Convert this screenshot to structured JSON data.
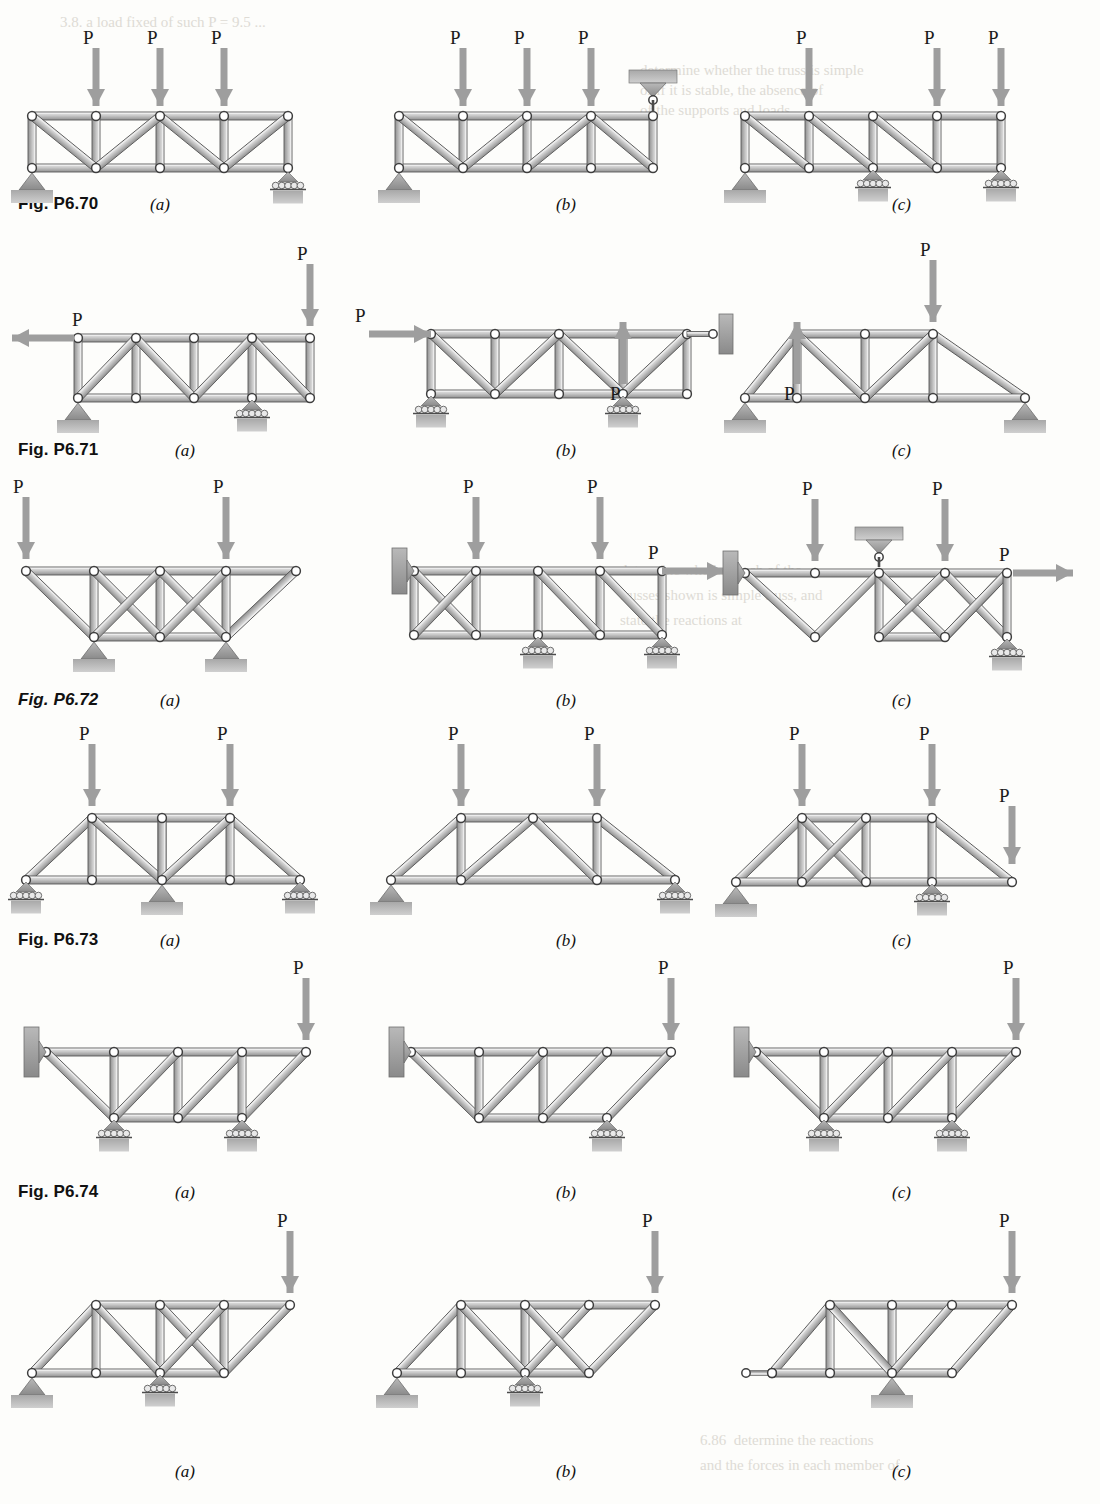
{
  "page": {
    "width": 1100,
    "height": 1504,
    "background": "#fdfdfb",
    "member_color_light": "#d8d8d8",
    "member_color_dark": "#8e8e8e",
    "outline_color": "#4a4a4a",
    "joint_fill": "#ffffff",
    "arrow_color": "#9a9a9a",
    "support_color": "#a5a5a5",
    "label_color": "#111111"
  },
  "load_label": "P",
  "figures": [
    {
      "id": "fig-p6-70",
      "label": "Fig. P6.70",
      "italic": false,
      "panels": [
        {
          "letter": "(a)",
          "name": "panel-a",
          "description": "Parallel chord truss, 4 panels, pin support left bottom, roller support right bottom, three downward loads P on top chord",
          "loads": [
            "P",
            "P",
            "P"
          ]
        },
        {
          "letter": "(b)",
          "name": "panel-b",
          "description": "Parallel chord truss with hanger link support at right top, pin support left bottom, three downward loads P on top chord",
          "loads": [
            "P",
            "P",
            "P"
          ]
        },
        {
          "letter": "(c)",
          "name": "panel-c",
          "description": "Parallel chord truss, pin support left bottom, two roller supports at bottom, three downward loads P on top chord",
          "loads": [
            "P",
            "P",
            "P"
          ]
        }
      ]
    },
    {
      "id": "fig-p6-71",
      "label": "Fig. P6.71",
      "italic": false,
      "panels": [
        {
          "letter": "(a)",
          "name": "panel-a",
          "description": "Parallel chord truss, horizontal load P to the left at top-left joint, downward load P at top-right joint, pin and roller supports on bottom chord",
          "loads": [
            "P",
            "P"
          ]
        },
        {
          "letter": "(b)",
          "name": "panel-b",
          "description": "Parallel chord truss with horizontal load P to the right at top-left, upward load P at an interior top joint, link support at right, roller supports at bottom",
          "loads": [
            "P",
            "P"
          ]
        },
        {
          "letter": "(c)",
          "name": "panel-c",
          "description": "Trapezoidal truss, upward load P at left top joint, downward load P at right top joint, pin support left and pin support right",
          "loads": [
            "P",
            "P"
          ]
        }
      ]
    },
    {
      "id": "fig-p6-72",
      "label": "Fig. P6.72",
      "italic": true,
      "panels": [
        {
          "letter": "(a)",
          "name": "panel-a",
          "description": "Inverted truss with straight top chord and cross-braced lower panels, two pin supports beneath lower joints, two downward loads P",
          "loads": [
            "P",
            "P"
          ]
        },
        {
          "letter": "(b)",
          "name": "panel-b",
          "description": "Two-segment truss attached to a wall bracket at left, horizontal load P to the right, two downward loads P, roller supports at bottom",
          "loads": [
            "P",
            "P",
            "P"
          ]
        },
        {
          "letter": "(c)",
          "name": "panel-c",
          "description": "Zigzag truss with wall bracket at left, hanger support at top center, horizontal load P to the right, two downward loads P, roller support at right",
          "loads": [
            "P",
            "P",
            "P"
          ]
        }
      ]
    },
    {
      "id": "fig-p6-73",
      "label": "Fig. P6.73",
      "italic": false,
      "panels": [
        {
          "letter": "(a)",
          "name": "panel-a",
          "description": "Trapezoidal truss with X-bracing at center, roller supports at both ends and pin support at center bottom, two downward loads P",
          "loads": [
            "P",
            "P"
          ]
        },
        {
          "letter": "(b)",
          "name": "panel-b",
          "description": "Simple trapezoidal truss, pin support at left bottom, roller support at right bottom, two downward loads P",
          "loads": [
            "P",
            "P"
          ]
        },
        {
          "letter": "(c)",
          "name": "panel-c",
          "description": "Trapezoidal truss with X-braced panel, pin support left, roller support at interior bottom joint, three downward loads P",
          "loads": [
            "P",
            "P",
            "P"
          ]
        }
      ]
    },
    {
      "id": "fig-p6-74",
      "label": "Fig. P6.74",
      "italic": false,
      "panels": [
        {
          "letter": "(a)",
          "name": "panel-a",
          "description": "Cantilever truss attached to wall bracket at left, straight top chord, two roller supports on the lower chord, downward load P at free right end",
          "loads": [
            "P"
          ]
        },
        {
          "letter": "(b)",
          "name": "panel-b",
          "description": "Cantilever truss attached to wall bracket at left, single roller support at lower chord, downward load P at free right end",
          "loads": [
            "P"
          ]
        },
        {
          "letter": "(c)",
          "name": "panel-c",
          "description": "Cantilever truss attached to wall bracket at left, two roller supports on lower chord, downward load P at free right end",
          "loads": [
            "P"
          ]
        }
      ]
    },
    {
      "id": "fig-p6-75",
      "label": "",
      "italic": false,
      "panels": [
        {
          "letter": "(a)",
          "name": "panel-a",
          "description": "Inclined-chord truss with X-braced right panel, pin support at lower left, roller support at interior lower joint, downward load P at right end",
          "loads": [
            "P"
          ]
        },
        {
          "letter": "(b)",
          "name": "panel-b",
          "description": "Inclined-chord truss with X-braced center panel, pin support at lower left, roller support at interior lower joint, downward load P at right end",
          "loads": [
            "P"
          ]
        },
        {
          "letter": "(c)",
          "name": "panel-c",
          "description": "Inclined-chord truss with link support at left, pin support at interior lower joint, downward load P at right end",
          "loads": [
            "P"
          ]
        }
      ]
    }
  ],
  "ghost_text": [
    {
      "x": 60,
      "y": 12,
      "text": "3.8. a load fixed of such P = 9.5 ..."
    },
    {
      "x": 640,
      "y": 60,
      "text": "determine whether the truss is simple"
    },
    {
      "x": 640,
      "y": 80,
      "text": "or if it is stable, the absence of"
    },
    {
      "x": 640,
      "y": 100,
      "text": "of the supports and loads."
    },
    {
      "x": 620,
      "y": 560,
      "text": "determine whether each of the"
    },
    {
      "x": 620,
      "y": 585,
      "text": "trusses shown is simple truss, and"
    },
    {
      "x": 620,
      "y": 610,
      "text": "state the reactions at"
    },
    {
      "x": 700,
      "y": 1430,
      "text": "6.86  determine the reactions"
    },
    {
      "x": 700,
      "y": 1455,
      "text": "and the forces in each member of"
    }
  ]
}
